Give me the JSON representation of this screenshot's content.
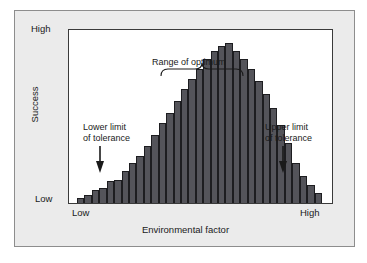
{
  "figure": {
    "y_axis": {
      "title": "Success",
      "tick_high": "High",
      "tick_low": "Low"
    },
    "x_axis": {
      "title": "Environmental factor",
      "tick_low": "Low",
      "tick_high": "High"
    },
    "annotations": {
      "range_of_optimum": "Range of optimum",
      "lower_limit_line1": "Lower limit",
      "lower_limit_line2": "of tolerance",
      "upper_limit_line1": "Upper limit",
      "upper_limit_line2": "of tolerance"
    },
    "colors": {
      "panel_background": "#ebebeb",
      "panel_border": "#8d8d8d",
      "plot_background": "#ffffff",
      "plot_border": "#3a3a3a",
      "bar_fill": "#54545a",
      "bar_outline": "#1d1d20",
      "text": "#1a1a1a"
    }
  },
  "chart_data": {
    "type": "bar",
    "title": "",
    "subtitle": "",
    "xlabel": "Environmental factor",
    "ylabel": "Success",
    "xlim": [
      0,
      34
    ],
    "ylim": [
      0,
      100
    ],
    "grid": false,
    "legend": null,
    "xtick_labels": [
      "Low",
      "High"
    ],
    "ytick_labels": [
      "Low",
      "High"
    ],
    "categories": [
      "1",
      "2",
      "3",
      "4",
      "5",
      "6",
      "7",
      "8",
      "9",
      "10",
      "11",
      "12",
      "13",
      "14",
      "15",
      "16",
      "17",
      "18",
      "19",
      "20",
      "21",
      "22",
      "23",
      "24",
      "25",
      "26",
      "27",
      "28",
      "29",
      "30",
      "31",
      "32",
      "33"
    ],
    "values": [
      3,
      5,
      8,
      9,
      13,
      14,
      19,
      24,
      28,
      34,
      41,
      48,
      54,
      61,
      68,
      74,
      80,
      86,
      91,
      94,
      96,
      91,
      86,
      80,
      73,
      65,
      57,
      47,
      36,
      24,
      16,
      11,
      6
    ],
    "annotations": [
      {
        "text": "Range of optimum",
        "type": "bracket",
        "x_start": 13,
        "x_end": 23
      },
      {
        "text": "Lower limit of tolerance",
        "type": "arrow",
        "x": 1
      },
      {
        "text": "Upper limit of tolerance",
        "type": "arrow",
        "x": 33
      }
    ]
  }
}
